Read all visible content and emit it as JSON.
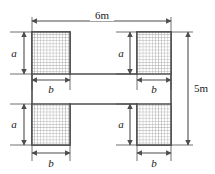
{
  "figure": {
    "colors": {
      "outline": "#4d4d4d",
      "hatch_line": "#8c8c8c",
      "hatch_fill": "#ffffff",
      "dimension_line": "#4d4d4d",
      "text": "#1a1a1a",
      "background": "#ffffff"
    },
    "dimensions": {
      "top_width": {
        "label": "6m",
        "value": 6,
        "unit": "m",
        "orientation": "horizontal",
        "position": "top"
      },
      "right_height": {
        "label": "5m",
        "value": 5,
        "unit": "m",
        "orientation": "vertical",
        "position": "right"
      }
    },
    "variables": {
      "a": {
        "label": "a",
        "meaning": "square side height",
        "orientation": "vertical",
        "occurrences": 4
      },
      "b": {
        "label": "b",
        "meaning": "square side width",
        "orientation": "horizontal",
        "occurrences": 4
      }
    },
    "corner_squares": [
      {
        "name": "top-left",
        "height_label": "a",
        "width_label": "b",
        "height_label_side": "left",
        "width_label_side": "below"
      },
      {
        "name": "top-right",
        "height_label": "a",
        "width_label": "b",
        "height_label_side": "left",
        "width_label_side": "below"
      },
      {
        "name": "bottom-left",
        "height_label": "a",
        "width_label": "b",
        "height_label_side": "left",
        "width_label_side": "below"
      },
      {
        "name": "bottom-right",
        "height_label": "a",
        "width_label": "b",
        "height_label_side": "left",
        "width_label_side": "below"
      }
    ]
  }
}
